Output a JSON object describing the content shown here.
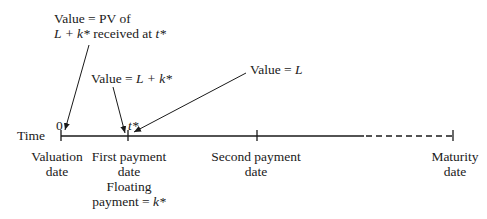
{
  "diagram": {
    "axis_label": "Time",
    "origin_label": "0",
    "tstar_label": "t*",
    "annotations": {
      "pv_line1": "Value = PV of",
      "pv_line2_pre": "L + k*",
      "pv_line2_post": " received at ",
      "pv_line2_t": "t*",
      "lk_pre": "Value = ",
      "lk_var": "L + k*",
      "l_pre": "Value = ",
      "l_var": "L"
    },
    "ticks": [
      {
        "name": "valuation",
        "line1": "Valuation",
        "line2": "date"
      },
      {
        "name": "first-payment",
        "line1": "First payment",
        "line2": "date",
        "line3": "Floating",
        "line4_pre": "payment = ",
        "line4_var": "k*"
      },
      {
        "name": "second-payment",
        "line1": "Second payment",
        "line2": "date"
      },
      {
        "name": "maturity",
        "line1": "Maturity",
        "line2": "date"
      }
    ],
    "colors": {
      "ink": "#1a1a1a",
      "background": "#ffffff"
    }
  }
}
